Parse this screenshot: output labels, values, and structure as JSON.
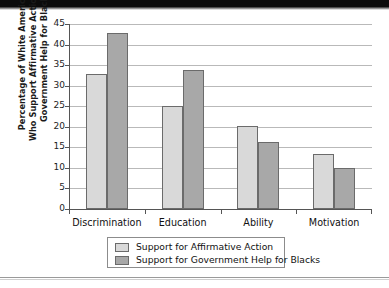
{
  "chart_data": {
    "type": "bar",
    "title": "",
    "xlabel": "",
    "ylabel_lines": [
      "Percentage of White Americans",
      "Who Support Affirmative Action and",
      "Government Help for Blacks"
    ],
    "categories": [
      "Discrimination",
      "Education",
      "Ability",
      "Motivation"
    ],
    "series": [
      {
        "name": "Support for Affirmative Action",
        "values": [
          32.8,
          25.1,
          20.3,
          13.3
        ],
        "color": "#d9d9d9"
      },
      {
        "name": "Support for Government Help for Blacks",
        "values": [
          42.7,
          33.7,
          16.3,
          10.0
        ],
        "color": "#a8a8a8"
      }
    ],
    "ylim": [
      0,
      45
    ],
    "ytick_values": [
      0,
      5,
      10,
      15,
      20,
      25,
      30,
      35,
      40,
      45
    ],
    "ytick_labels": [
      "0",
      "5",
      "10",
      "15",
      "20",
      "25",
      "30",
      "35",
      "40",
      "45"
    ],
    "grid": true,
    "legend_position": "bottom"
  },
  "legend": {
    "items": [
      {
        "label": "Support for Affirmative Action",
        "swatch": "light"
      },
      {
        "label": "Support for Government Help for Blacks",
        "swatch": "dark"
      }
    ]
  }
}
